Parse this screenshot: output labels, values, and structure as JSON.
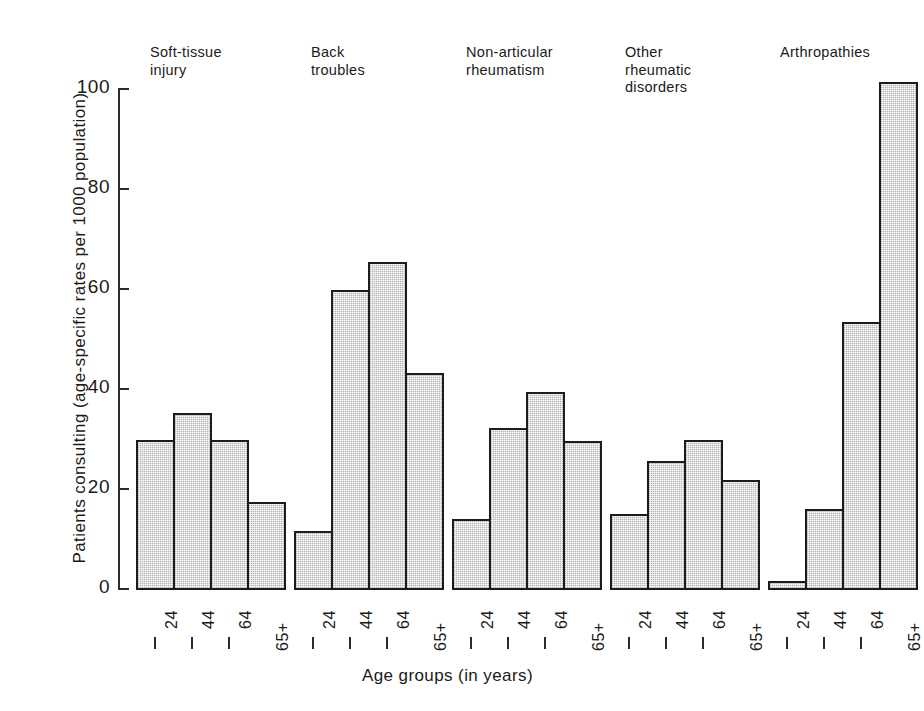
{
  "chart_data": {
    "type": "bar",
    "title": "",
    "xlabel": "Age groups (in years)",
    "ylabel": "Patients consulting (age-specific rates per 1000 population)",
    "categories": [
      "– 24",
      "– 44",
      "– 64",
      "65+"
    ],
    "ylim": [
      0,
      100
    ],
    "yticks": [
      0,
      20,
      40,
      60,
      80,
      100
    ],
    "ytick_labels": [
      "0",
      "20",
      "40",
      "60",
      "80",
      "100"
    ],
    "grid": false,
    "legend_position": "none",
    "bar_fill": "#b5b5b5",
    "bar_edge": "#1c1c1c",
    "groups": [
      {
        "name": "Soft-tissue\ninjury",
        "values": [
          29.8,
          35.2,
          29.8,
          17.4
        ]
      },
      {
        "name": "Back\ntroubles",
        "values": [
          11.7,
          59.8,
          65.5,
          43.2
        ]
      },
      {
        "name": "Non-articular\nrheumatism",
        "values": [
          14.0,
          32.3,
          39.5,
          29.7
        ]
      },
      {
        "name": "Other\nrheumatic\ndisorders",
        "values": [
          15.0,
          25.6,
          29.9,
          21.8
        ]
      },
      {
        "name": "Arthropathies",
        "values": [
          1.6,
          16.0,
          53.4,
          101.5
        ]
      }
    ]
  }
}
